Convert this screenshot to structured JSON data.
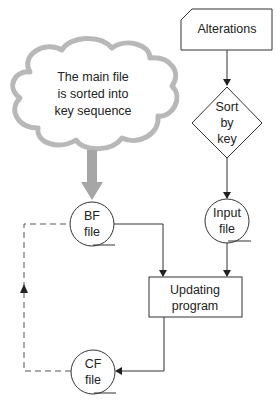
{
  "diagram": {
    "type": "system-flowchart",
    "nodes": {
      "alterations": {
        "shape": "punched-card",
        "label": "Alterations"
      },
      "sort": {
        "shape": "decision-diamond",
        "lines": [
          "Sort",
          "by",
          "key"
        ]
      },
      "input_file": {
        "shape": "magnetic-tape",
        "lines": [
          "Input",
          "file"
        ]
      },
      "bf_file": {
        "shape": "magnetic-tape",
        "lines": [
          "BF",
          "file"
        ]
      },
      "cf_file": {
        "shape": "magnetic-tape",
        "lines": [
          "CF",
          "file"
        ]
      },
      "updating": {
        "shape": "process",
        "lines": [
          "Updating",
          "program"
        ]
      }
    },
    "annotation": {
      "shape": "cloud",
      "lines": [
        "The main file",
        "is sorted into",
        "key sequence"
      ]
    },
    "edges": [
      {
        "from": "alterations",
        "to": "sort",
        "style": "solid"
      },
      {
        "from": "sort",
        "to": "input_file",
        "style": "solid"
      },
      {
        "from": "input_file",
        "to": "updating",
        "style": "solid"
      },
      {
        "from": "bf_file",
        "to": "updating",
        "style": "solid"
      },
      {
        "from": "updating",
        "to": "cf_file",
        "style": "solid"
      },
      {
        "from": "cf_file",
        "to": "bf_file",
        "style": "dashed"
      },
      {
        "from": "annotation",
        "to": "bf_file",
        "style": "thick-grey"
      }
    ],
    "colors": {
      "line": "#333333",
      "cloud": "#b8b8b8",
      "thick_arrow": "#a6a6a6"
    }
  }
}
